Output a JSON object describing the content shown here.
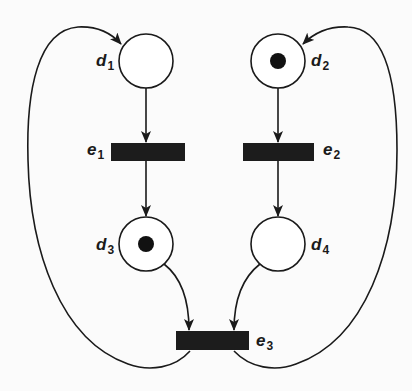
{
  "diagram": {
    "type": "petri-net",
    "colors": {
      "stroke": "#1a1a1a",
      "fill": "#ffffff",
      "token": "#111111",
      "transition": "#1c1c1c",
      "background": "#fbfbfb"
    },
    "places": [
      {
        "id": "d1",
        "letter": "d",
        "sub": "1",
        "tokens": 0
      },
      {
        "id": "d2",
        "letter": "d",
        "sub": "2",
        "tokens": 1
      },
      {
        "id": "d3",
        "letter": "d",
        "sub": "3",
        "tokens": 1
      },
      {
        "id": "d4",
        "letter": "d",
        "sub": "4",
        "tokens": 0
      }
    ],
    "transitions": [
      {
        "id": "e1",
        "letter": "e",
        "sub": "1"
      },
      {
        "id": "e2",
        "letter": "e",
        "sub": "2"
      },
      {
        "id": "e3",
        "letter": "e",
        "sub": "3"
      }
    ],
    "arcs": [
      {
        "from": "d1",
        "to": "e1"
      },
      {
        "from": "e1",
        "to": "d3"
      },
      {
        "from": "d2",
        "to": "e2"
      },
      {
        "from": "e2",
        "to": "d4"
      },
      {
        "from": "d3",
        "to": "e3"
      },
      {
        "from": "d4",
        "to": "e3"
      },
      {
        "from": "e3",
        "to": "d1"
      },
      {
        "from": "e3",
        "to": "d2"
      }
    ]
  }
}
